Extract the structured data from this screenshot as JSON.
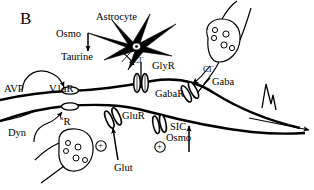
{
  "figure": {
    "panel_label": "B",
    "domain": "neuroscience-synapse-diagram",
    "background_color": "#ffffff",
    "ink_color": "#000000"
  },
  "labels": {
    "astrocyte": "Astrocyte",
    "osmo_top": "Osmo",
    "taurine": "Taurine",
    "chloride_glyr": "Cl",
    "chloride_sup": "-",
    "glyr": "GlyR",
    "chloride_gaba": "Cl",
    "gabar": "GabaR",
    "gaba": "Gaba",
    "avp": "AVP",
    "v1ar": "V1aR",
    "dyn": "Dyn",
    "kappa_char": "κ",
    "kappa_r": "R",
    "glur": "GluR",
    "glut": "Glut",
    "sic": "SIC",
    "osmo_bottom": "Osmo",
    "plus_glut": "+",
    "plus_sic": "+"
  },
  "elements": {
    "astrocyte_cell": "star-shaped-glial-cell",
    "astrocyte_nucleus": "nucleus",
    "gaba_terminal": "presynaptic-bouton-with-vesicles",
    "gaba_vesicle_count": 5,
    "glut_terminal": "presynaptic-bouton-with-vesicles",
    "glut_vesicle_count": 5,
    "dendrite_upper": "postsynaptic-dendrite-membrane",
    "dendrite_lower": "postsynaptic-dendrite-membrane",
    "v1ar_receptor": "oval-metabotropic-receptor",
    "kappa_receptor": "oval-metabotropic-receptor",
    "glyr_channel": "ligand-gated-ion-channel-barrel",
    "gabar_channel": "ligand-gated-ion-channel-barrel-tilted",
    "glur_channel": "ligand-gated-ion-channel-barrel-tilted",
    "sic_channel": "slow-inward-current-channel",
    "action_potential": "spike-trace"
  }
}
